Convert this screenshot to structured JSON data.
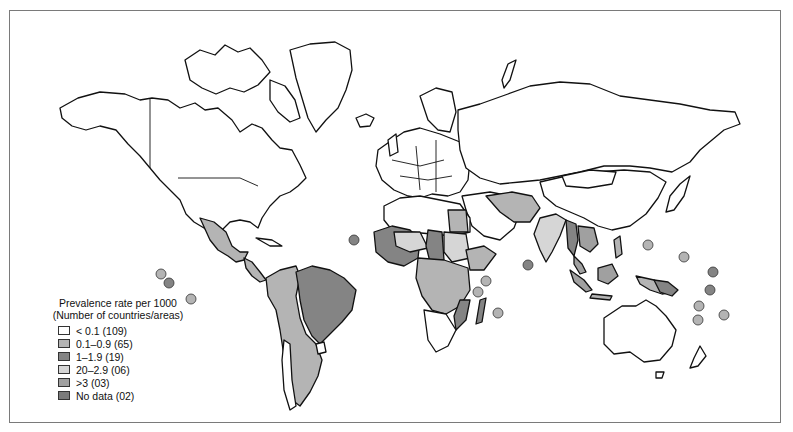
{
  "map": {
    "type": "choropleth world map",
    "legend": {
      "title_line1": "Prevalence rate per 1000",
      "title_line2": "(Number of countries/areas)",
      "items": [
        {
          "label": "< 0.1  (109)",
          "range": "< 0.1",
          "count": "109",
          "color": "#ffffff"
        },
        {
          "label": "0.1–0.9  (65)",
          "range": "0.1–0.9",
          "count": "65",
          "color": "#b4b4b4"
        },
        {
          "label": "1–1.9  (19)",
          "range": "1–1.9",
          "count": "19",
          "color": "#848484"
        },
        {
          "label": "20–2.9  (06)",
          "range": "20–2.9",
          "count": "06",
          "color": "#d6d6d6"
        },
        {
          "label": ">3  (03)",
          "range": ">3",
          "count": "03",
          "color": "#a0a0a0"
        },
        {
          "label": "No data  (02)",
          "range": "No data",
          "count": "02",
          "color": "#7a7a7a"
        }
      ]
    },
    "colors": {
      "none": "#ffffff",
      "low": "#b4b4b4",
      "mid": "#848484",
      "light": "#d6d6d6",
      "high": "#a0a0a0",
      "nodata": "#7a7a7a",
      "outline": "#111111",
      "frame": "#7a7a7a"
    }
  }
}
